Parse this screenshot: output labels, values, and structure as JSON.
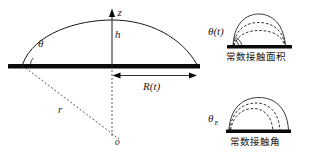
{
  "figure": {
    "background_color": "#ffffff",
    "ink_color": "#1a1a1a",
    "main_panel": {
      "name": "sessile-droplet-geometry",
      "labels": {
        "z_axis": "z",
        "height": "h",
        "contact_angle": "θ",
        "radius_of_curvature": "r",
        "center_of_curvature": "o",
        "contact_radius": "R(t)"
      }
    },
    "inset_top": {
      "name": "constant-contact-area-mode",
      "angle_label": "θ(t)",
      "caption": "常数接触面积"
    },
    "inset_bottom": {
      "name": "constant-contact-angle-mode",
      "angle_label": "θ",
      "angle_label_sub": "E",
      "caption": "常数接触角"
    }
  }
}
